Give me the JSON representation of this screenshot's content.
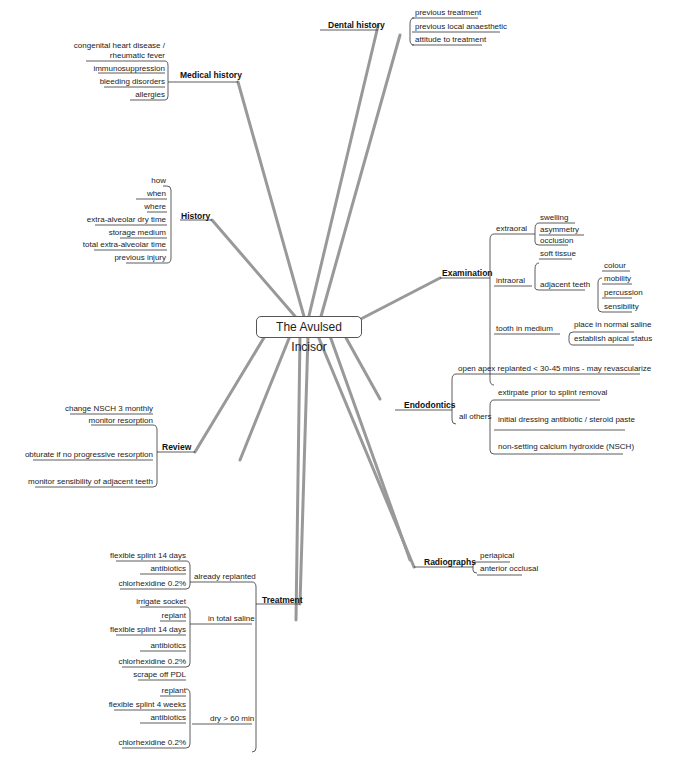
{
  "center": "The Avulsed Incisor",
  "medical_history": {
    "label": "Medical history",
    "items": [
      "congenital heart disease /",
      "rheumatic fever",
      "immunosuppression",
      "bleeding disorders",
      "allergies"
    ]
  },
  "dental_history": {
    "label": "Dental history",
    "items": [
      "previous treatment",
      "previous local anaesthetic",
      "attitude to treatment"
    ]
  },
  "history": {
    "label": "History",
    "items": [
      "how",
      "when",
      "where",
      "extra-alveolar dry time",
      "storage medium",
      "total extra-alveolar time",
      "previous injury"
    ]
  },
  "examination": {
    "label": "Examination",
    "extraoral": "extraoral",
    "extraoral_items": [
      "swelling",
      "asymmetry",
      "occlusion"
    ],
    "intraoral": "intraoral",
    "soft_tissue": "soft tissue",
    "adjacent_teeth": "adjacent teeth",
    "adjacent_items": [
      "colour",
      "mobility",
      "percussion",
      "sensibility"
    ],
    "tooth_in_medium": "tooth in medium",
    "medium_items": [
      "place in normal saline",
      "establish apical status"
    ]
  },
  "endodontics": {
    "label": "Endodontics",
    "open_apex": "open apex replanted < 30-45 mins - may revascularize",
    "all_others": "all others",
    "others_items": [
      "extirpate prior to splint removal",
      "initial dressing antibiotic / steroid paste",
      "non-setting calcium hydroxide (NSCH)"
    ]
  },
  "review": {
    "label": "Review",
    "items": [
      "change NSCH 3 monthly",
      "monitor resorption",
      "obturate if no progressive resorption",
      "monitor sensibility of adjacent teeth"
    ]
  },
  "radiographs": {
    "label": "Radiographs",
    "items": [
      "periapical",
      "anterior occlusal"
    ]
  },
  "treatment": {
    "label": "Treatment",
    "already": "already replanted",
    "already_items": [
      "flexible splint 14 days",
      "antibiotics",
      "chlorhexidine 0.2%"
    ],
    "saline": "in total saline",
    "saline_items": [
      "irrigate socket",
      "replant",
      "flexible splint 14 days",
      "antibiotics",
      "chlorhexidine 0.2%"
    ],
    "dry": "dry > 60 min",
    "dry_items": [
      "scrape off PDL",
      "replant",
      "flexible splint 4 weeks",
      "antibiotics",
      "chlorhexidine 0.2%"
    ]
  }
}
